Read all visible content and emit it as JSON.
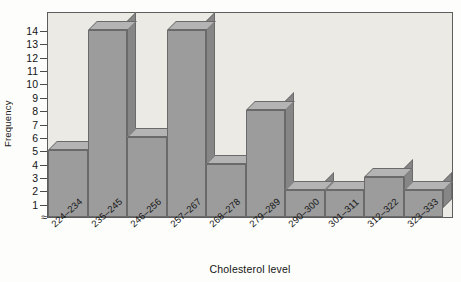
{
  "chart_data": {
    "type": "bar",
    "title": "",
    "xlabel": "Cholesterol level",
    "ylabel": "Frequency",
    "categories": [
      "224–234",
      "235–245",
      "246–256",
      "257–267",
      "268–278",
      "279–289",
      "290–300",
      "301–311",
      "312–322",
      "323–333"
    ],
    "values": [
      5,
      14,
      6,
      14,
      4,
      8,
      2,
      2,
      3,
      2
    ],
    "ylim": [
      0,
      14
    ],
    "yticks": [
      1,
      2,
      3,
      4,
      5,
      6,
      7,
      8,
      9,
      10,
      11,
      12,
      13,
      14
    ],
    "ytick_labels": [
      "1",
      "2",
      "3",
      "4",
      "5",
      "6",
      "7",
      "8",
      "9",
      "10",
      "11",
      "12",
      "13",
      "14"
    ],
    "grid": false,
    "legend": false,
    "axis_break": "≈",
    "style": "3d-histogram",
    "colors": {
      "bar_front": "#9c9c9c",
      "bar_top": "#b4b4b4",
      "bar_side": "#868686",
      "bar_outline": "#6a6a6a",
      "plot_background": "#eceae5",
      "plot_border": "#5d5d5d",
      "page_background": "#fdfdfb",
      "text": "#141414"
    }
  }
}
